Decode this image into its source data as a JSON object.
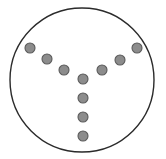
{
  "figure": {
    "type": "dot-diagram",
    "canvas": {
      "width": 166,
      "height": 159,
      "background": "#ffffff"
    },
    "boundary": {
      "shape": "circle",
      "cx": 82,
      "cy": 80,
      "r": 72,
      "stroke_color": "#2b2b2b",
      "stroke_width": 1.4,
      "fill_color": "#ffffff"
    },
    "dot_style": {
      "radius": 5,
      "fill_color": "#8c8c8c",
      "stroke_color": "#595959",
      "stroke_width": 1.1
    },
    "dot_count": 10,
    "branches": [
      {
        "name": "left-arm",
        "dot_count": 3
      },
      {
        "name": "right-arm",
        "dot_count": 3
      },
      {
        "name": "stem",
        "dot_count": 4
      }
    ],
    "dots": [
      {
        "id": 1,
        "branch": "left-arm",
        "label": "left-arm-outer",
        "cx": 30,
        "cy": 48
      },
      {
        "id": 2,
        "branch": "left-arm",
        "label": "left-arm-middle",
        "cx": 47,
        "cy": 59
      },
      {
        "id": 3,
        "branch": "left-arm",
        "label": "left-arm-inner",
        "cx": 64,
        "cy": 70
      },
      {
        "id": 4,
        "branch": "right-arm",
        "label": "right-arm-inner",
        "cx": 102,
        "cy": 70
      },
      {
        "id": 5,
        "branch": "right-arm",
        "label": "right-arm-middle",
        "cx": 120,
        "cy": 60
      },
      {
        "id": 6,
        "branch": "right-arm",
        "label": "right-arm-outer",
        "cx": 137,
        "cy": 48
      },
      {
        "id": 7,
        "branch": "stem",
        "label": "stem-junction",
        "cx": 83,
        "cy": 79
      },
      {
        "id": 8,
        "branch": "stem",
        "label": "stem-upper",
        "cx": 83,
        "cy": 98
      },
      {
        "id": 9,
        "branch": "stem",
        "label": "stem-lower",
        "cx": 83,
        "cy": 117
      },
      {
        "id": 10,
        "branch": "stem",
        "label": "stem-bottom",
        "cx": 83,
        "cy": 136
      }
    ]
  },
  "chart_data": {
    "type": "scatter",
    "xlabel": "",
    "ylabel": "",
    "xlim": [
      0,
      166
    ],
    "ylim": [
      0,
      159
    ],
    "grid": false,
    "legend": null,
    "series": [
      {
        "name": "nodes",
        "marker": "circle",
        "marker_size": 10,
        "color": "#8c8c8c",
        "edge_color": "#595959",
        "x": [
          30,
          47,
          64,
          102,
          120,
          137,
          83,
          83,
          83,
          83
        ],
        "y": [
          48,
          59,
          70,
          70,
          60,
          48,
          79,
          98,
          117,
          136
        ]
      }
    ],
    "annotations": [
      {
        "name": "boundary-circle",
        "shape": "circle",
        "cx": 82,
        "cy": 80,
        "r": 72,
        "filled": false
      }
    ]
  }
}
